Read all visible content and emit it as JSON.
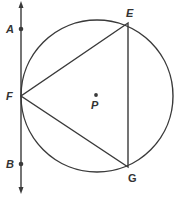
{
  "diagram": {
    "type": "geometry",
    "colors": {
      "stroke": "#3a3a3a",
      "label": "#333333",
      "background": "#ffffff"
    },
    "circle": {
      "center_label": "P",
      "cx": 97,
      "cy": 96,
      "r": 76
    },
    "tangent_line": {
      "x": 21,
      "y_top": 3,
      "y_bottom": 192,
      "arrows": "both"
    },
    "points": [
      {
        "name": "A",
        "label": "A",
        "x": 21,
        "y": 29
      },
      {
        "name": "B",
        "label": "B",
        "x": 21,
        "y": 164
      },
      {
        "name": "F",
        "label": "F",
        "x": 21,
        "y": 96
      },
      {
        "name": "E",
        "label": "E",
        "x": 128,
        "y": 23
      },
      {
        "name": "G",
        "label": "G",
        "x": 128,
        "y": 167
      },
      {
        "name": "P",
        "label": "P",
        "x": 96,
        "y": 95
      }
    ],
    "triangle": [
      "E",
      "F",
      "G"
    ]
  }
}
